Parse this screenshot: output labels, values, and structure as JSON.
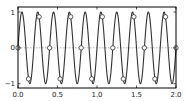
{
  "chart_data": {
    "type": "line",
    "title": "",
    "xlabel": "",
    "ylabel": "",
    "xlim": [
      0.0,
      2.0
    ],
    "ylim": [
      -1.12,
      1.14
    ],
    "grid": false,
    "legend": null,
    "x_ticks": [
      0.0,
      0.5,
      1.0,
      1.5,
      2.0
    ],
    "x_tick_labels": [
      "0.0",
      "0.5",
      "1.0",
      "1.5",
      "2.0"
    ],
    "y_ticks": [
      -1,
      0,
      1
    ],
    "y_tick_labels": [
      "−1",
      "0",
      "1"
    ],
    "series": [
      {
        "name": "signal",
        "style": "solid line",
        "color": "#333333",
        "function": "sin(2*pi*5*x)",
        "frequency_hz": 5,
        "x_range": [
          0.0,
          2.0
        ]
      },
      {
        "name": "samples",
        "style": "open circle markers",
        "color": "#333333",
        "sample_spacing": 0.1333,
        "x": [
          0.0,
          0.133,
          0.267,
          0.4,
          0.533,
          0.667,
          0.8,
          0.933,
          1.067,
          1.2,
          1.333,
          1.467,
          1.6,
          1.733,
          1.867,
          2.0
        ],
        "y": [
          0.0,
          -0.866,
          0.866,
          0.0,
          -0.866,
          0.866,
          0.0,
          -0.866,
          0.866,
          0.0,
          -0.866,
          0.866,
          0.0,
          -0.866,
          0.866,
          0.0
        ]
      },
      {
        "name": "zero-line",
        "style": "dotted line",
        "color": "#999999",
        "y": 0
      }
    ]
  },
  "layout": {
    "plot_left": 18,
    "plot_top": 7,
    "plot_right": 176,
    "plot_bottom": 88
  }
}
